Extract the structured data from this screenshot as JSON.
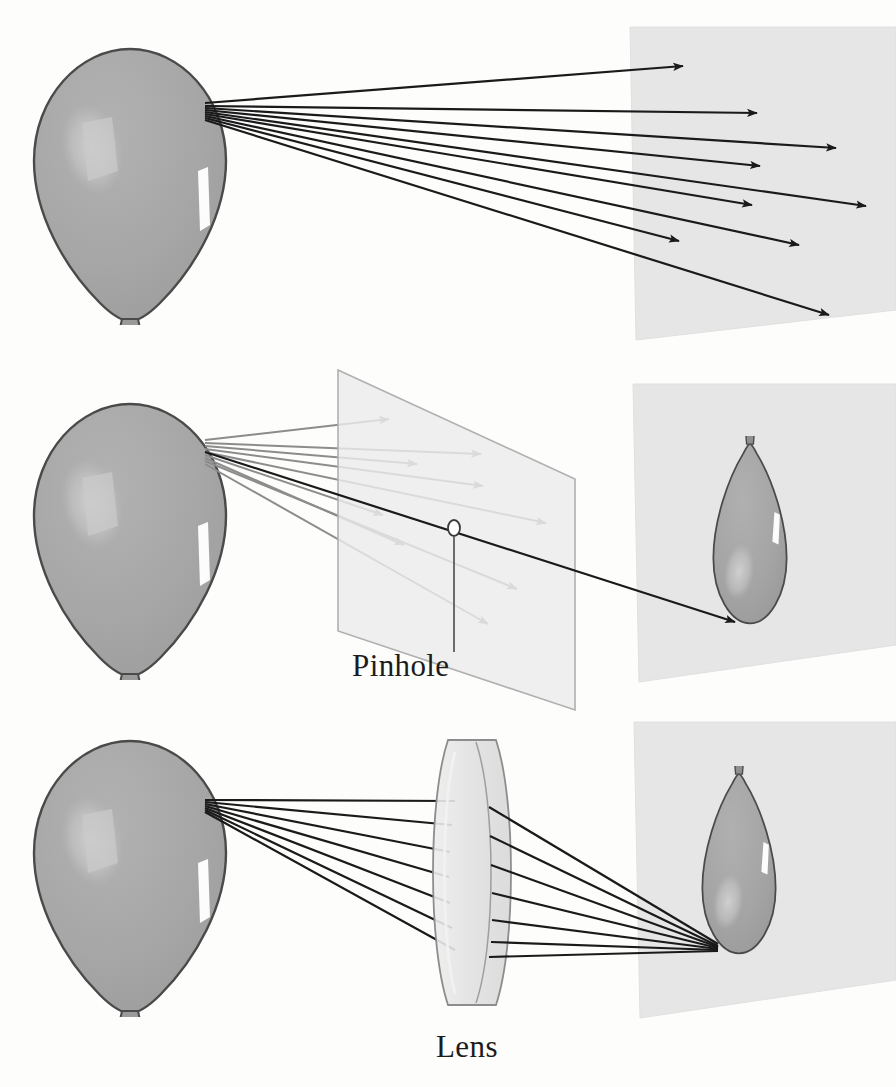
{
  "figure": {
    "background_color": "#fdfdfc",
    "width": 896,
    "height": 1087
  },
  "palette": {
    "balloon_fill": "#a8a8a8",
    "balloon_fill_dark": "#9a9a9a",
    "balloon_outline": "#4a4a4a",
    "balloon_highlight_soft": "#c4c4c4",
    "balloon_highlight_white": "#ffffff",
    "screen_fill": "#e6e6e6",
    "screen_outline": "#d4d4d4",
    "barrier_fill": "#ebebeb",
    "barrier_outline": "#b0b0b0",
    "lens_fill": "#e4e4e4",
    "lens_outline": "#8d8d8d",
    "ray_dark": "#1a1a1a",
    "ray_blocked": "#8c8c8c",
    "label_color": "#1c1c1c",
    "leader_line": "#4a4a4a"
  },
  "panels": [
    {
      "id": "panel-open",
      "index": 1,
      "name": "no-optics-panel",
      "description": "Light rays from one point on the balloon spread out and strike the screen everywhere, so no image forms.",
      "label": "",
      "has_label": false,
      "object": {
        "name": "balloon-object",
        "inverted": false,
        "center_x": 128,
        "center_y": 180,
        "width": 196,
        "height": 270
      },
      "screen": {
        "name": "projection-screen",
        "top_left": [
          630,
          27
        ],
        "top_right": [
          896,
          27
        ],
        "bottom_right": [
          896,
          310
        ],
        "bottom_left": [
          636,
          340
        ],
        "shading": "#e6e6e6"
      },
      "ray_origin": [
        205,
        103
      ],
      "ray_count": 9,
      "ray_color": "#1a1a1a",
      "ray_endpoints": [
        [
          683,
          66
        ],
        [
          757,
          113
        ],
        [
          836,
          148
        ],
        [
          760,
          166
        ],
        [
          866,
          206
        ],
        [
          752,
          205
        ],
        [
          799,
          245
        ],
        [
          679,
          241
        ],
        [
          829,
          315
        ]
      ]
    },
    {
      "id": "panel-pinhole",
      "index": 2,
      "name": "pinhole-panel",
      "description": "A barrier with a single small hole blocks all rays but one, so an inverted image of the balloon appears on the screen.",
      "label": "Pinhole",
      "has_label": true,
      "label_position": [
        352,
        676
      ],
      "object": {
        "name": "balloon-object",
        "inverted": false,
        "center_x": 128,
        "center_y": 535,
        "width": 196,
        "height": 265
      },
      "barrier": {
        "name": "pinhole-barrier",
        "top_left": [
          338,
          370
        ],
        "top_right": [
          575,
          479
        ],
        "bottom_right": [
          575,
          710
        ],
        "bottom_left": [
          338,
          631
        ],
        "fill": "#ebebeb"
      },
      "aperture": {
        "name": "pinhole-aperture",
        "cx": 454,
        "cy": 528,
        "rx": 6,
        "ry": 8
      },
      "leader": {
        "name": "pinhole-leader-line",
        "from": [
          454,
          536
        ],
        "to": [
          454,
          652
        ]
      },
      "screen": {
        "name": "projection-screen",
        "top_left": [
          633,
          384
        ],
        "top_right": [
          896,
          384
        ],
        "bottom_right": [
          896,
          645
        ],
        "bottom_left": [
          639,
          682
        ],
        "shading": "#e6e6e6"
      },
      "ray_origin": [
        205,
        440
      ],
      "ray_count": 9,
      "blocked_ray_color": "#8c8c8c",
      "through_ray_color": "#1a1a1a",
      "blocked_ray_endpoints": [
        [
          389,
          419
        ],
        [
          481,
          454
        ],
        [
          417,
          464
        ],
        [
          483,
          486
        ],
        [
          546,
          523
        ],
        [
          383,
          515
        ],
        [
          404,
          545
        ],
        [
          517,
          589
        ],
        [
          488,
          624
        ]
      ],
      "image": {
        "name": "inverted-balloon-image",
        "inverted": true,
        "center_x": 732,
        "center_y": 530,
        "width": 84,
        "height": 190
      },
      "image_ray": {
        "name": "pinhole-image-ray",
        "from": [
          205,
          440
        ],
        "through": [
          454,
          528
        ],
        "to": [
          735,
          622
        ]
      }
    },
    {
      "id": "panel-lens",
      "index": 3,
      "name": "lens-panel",
      "description": "A converging lens refracts all the rays from one object point back to a single point, forming a bright inverted image on the screen.",
      "label": "Lens",
      "has_label": true,
      "label_position": [
        436,
        1057
      ],
      "object": {
        "name": "balloon-object",
        "inverted": false,
        "center_x": 128,
        "center_y": 872,
        "width": 196,
        "height": 265
      },
      "lens": {
        "name": "converging-lens",
        "center_x": 472,
        "top_y": 740,
        "bottom_y": 1005,
        "half_thickness": 24,
        "fill": "#e4e4e4"
      },
      "screen": {
        "name": "projection-screen",
        "top_left": [
          634,
          722
        ],
        "top_right": [
          896,
          722
        ],
        "bottom_right": [
          896,
          980
        ],
        "bottom_left": [
          640,
          1018
        ],
        "shading": "#e6e6e6"
      },
      "ray_origin": [
        205,
        800
      ],
      "ray_count": 7,
      "ray_color": "#1a1a1a",
      "focus_point": [
        718,
        948
      ],
      "lens_entry_points": [
        [
          455,
          801
        ],
        [
          452,
          825
        ],
        [
          450,
          852
        ],
        [
          449,
          877
        ],
        [
          450,
          903
        ],
        [
          452,
          928
        ],
        [
          455,
          950
        ]
      ],
      "lens_exit_points": [
        [
          489,
          807
        ],
        [
          490,
          836
        ],
        [
          491,
          865
        ],
        [
          492,
          893
        ],
        [
          492,
          920
        ],
        [
          491,
          942
        ],
        [
          489,
          957
        ]
      ],
      "image": {
        "name": "inverted-balloon-image",
        "inverted": true,
        "center_x": 722,
        "center_y": 860,
        "width": 86,
        "height": 190
      }
    }
  ],
  "labels": {
    "pinhole": "Pinhole",
    "lens": "Lens"
  }
}
